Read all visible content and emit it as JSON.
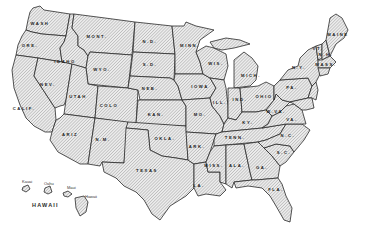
{
  "map": {
    "title": "United States (outline map)",
    "colors": {
      "stroke": "#2a2a2a",
      "hatch": "#8a8a8a",
      "background": "#ffffff",
      "fill": "#e6e6e6"
    },
    "states": [
      {
        "id": "wa",
        "label": "WASH",
        "x": 40,
        "y": 25
      },
      {
        "id": "or",
        "label": "ORE.",
        "x": 30,
        "y": 47
      },
      {
        "id": "ca",
        "label": "CALIF.",
        "x": 24,
        "y": 110
      },
      {
        "id": "id",
        "label": "IDAHO",
        "x": 65,
        "y": 63
      },
      {
        "id": "nv",
        "label": "NEV.",
        "x": 48,
        "y": 86
      },
      {
        "id": "mt",
        "label": "MONT.",
        "x": 97,
        "y": 38
      },
      {
        "id": "wy",
        "label": "WYO.",
        "x": 102,
        "y": 71
      },
      {
        "id": "ut",
        "label": "UTAH",
        "x": 78,
        "y": 98
      },
      {
        "id": "co",
        "label": "COLO",
        "x": 109,
        "y": 107
      },
      {
        "id": "az",
        "label": "ARIZ",
        "x": 70,
        "y": 136
      },
      {
        "id": "nm",
        "label": "N.M.",
        "x": 103,
        "y": 141
      },
      {
        "id": "nd",
        "label": "N.D.",
        "x": 150,
        "y": 43
      },
      {
        "id": "sd",
        "label": "S.D.",
        "x": 150,
        "y": 66
      },
      {
        "id": "ne",
        "label": "NEB.",
        "x": 150,
        "y": 90
      },
      {
        "id": "ks",
        "label": "KAN.",
        "x": 156,
        "y": 116
      },
      {
        "id": "ok",
        "label": "OKLA.",
        "x": 165,
        "y": 140
      },
      {
        "id": "tx",
        "label": "TEXAS",
        "x": 147,
        "y": 172
      },
      {
        "id": "mn",
        "label": "MINN.",
        "x": 190,
        "y": 47
      },
      {
        "id": "ia",
        "label": "IOWA",
        "x": 200,
        "y": 88
      },
      {
        "id": "mo",
        "label": "MO.",
        "x": 200,
        "y": 116
      },
      {
        "id": "ar",
        "label": "ARK.",
        "x": 197,
        "y": 148
      },
      {
        "id": "la",
        "label": "LA.",
        "x": 199,
        "y": 187
      },
      {
        "id": "wi",
        "label": "WIS.",
        "x": 216,
        "y": 65
      },
      {
        "id": "il",
        "label": "ILL.",
        "x": 220,
        "y": 104
      },
      {
        "id": "mi",
        "label": "MICH.",
        "x": 251,
        "y": 77
      },
      {
        "id": "in",
        "label": "IND.",
        "x": 240,
        "y": 101
      },
      {
        "id": "oh",
        "label": "OHIO",
        "x": 264,
        "y": 98
      },
      {
        "id": "ky",
        "label": "KY.",
        "x": 248,
        "y": 124
      },
      {
        "id": "tn",
        "label": "TENN.",
        "x": 235,
        "y": 139
      },
      {
        "id": "ms",
        "label": "MISS.",
        "x": 214,
        "y": 167
      },
      {
        "id": "al",
        "label": "ALA.",
        "x": 237,
        "y": 167
      },
      {
        "id": "ga",
        "label": "GA.",
        "x": 262,
        "y": 169
      },
      {
        "id": "fl",
        "label": "FLA.",
        "x": 276,
        "y": 191
      },
      {
        "id": "sc",
        "label": "S.C.",
        "x": 284,
        "y": 154
      },
      {
        "id": "nc",
        "label": "N.C.",
        "x": 288,
        "y": 137
      },
      {
        "id": "va",
        "label": "VA.",
        "x": 292,
        "y": 121
      },
      {
        "id": "wv",
        "label": "W.VA.",
        "x": 276,
        "y": 113
      },
      {
        "id": "pa",
        "label": "PA.",
        "x": 292,
        "y": 89
      },
      {
        "id": "ny",
        "label": "N.Y.",
        "x": 299,
        "y": 69
      },
      {
        "id": "vt",
        "label": "VT.",
        "x": 318,
        "y": 50
      },
      {
        "id": "nh",
        "label": "N.H.",
        "x": 326,
        "y": 56
      },
      {
        "id": "me",
        "label": "MAINE",
        "x": 338,
        "y": 36
      },
      {
        "id": "ma",
        "label": "MASS.",
        "x": 326,
        "y": 66
      }
    ],
    "hawaii": {
      "title": "HAWAII",
      "islands": [
        {
          "id": "kauai",
          "label": "Kauai"
        },
        {
          "id": "oahu",
          "label": "Oahu"
        },
        {
          "id": "maui",
          "label": "Maui"
        },
        {
          "id": "hawaii",
          "label": "Hawaii"
        }
      ]
    }
  }
}
